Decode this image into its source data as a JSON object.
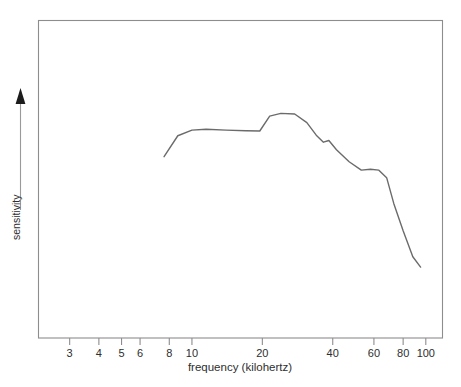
{
  "chart_data": {
    "type": "line",
    "title": "",
    "xlabel": "frequency (kilohertz)",
    "ylabel": "sensitivity",
    "xscale": "log",
    "xlim": [
      2.4,
      115
    ],
    "ylim": [
      0,
      1
    ],
    "grid": false,
    "legend": null,
    "xticks": [
      3,
      4,
      5,
      6,
      8,
      10,
      20,
      40,
      60,
      80,
      100
    ],
    "xtick_labels": [
      "3",
      "4",
      "5",
      "6",
      "8",
      "10",
      "20",
      "40",
      "60",
      "80",
      "100"
    ],
    "yticks": [],
    "ytick_labels": [],
    "series": [
      {
        "name": "sensitivity",
        "color": "#6b6b6b",
        "x": [
          7.6,
          8.7,
          10.0,
          11.5,
          14.0,
          17.0,
          19.5,
          21.5,
          24.0,
          27.5,
          31.0,
          34.0,
          36.5,
          38.5,
          41.5,
          47.0,
          53.0,
          58.0,
          63.0,
          68.0,
          73.0,
          80.0,
          88.0,
          95.0
        ],
        "y": [
          0.62,
          0.695,
          0.715,
          0.718,
          0.715,
          0.713,
          0.712,
          0.765,
          0.775,
          0.773,
          0.742,
          0.697,
          0.672,
          0.678,
          0.645,
          0.602,
          0.572,
          0.575,
          0.572,
          0.545,
          0.452,
          0.355,
          0.262,
          0.225
        ]
      }
    ],
    "annotations": {
      "y_axis_arrow": "upward arrow indicating increasing sensitivity"
    }
  },
  "axis": {
    "x_title": "frequency (kilohertz)",
    "y_title": "sensitivity"
  },
  "colors": {
    "curve": "#6b6b6b",
    "frame": "#8d8d8d",
    "text": "#2e2e2e",
    "background": "#ffffff"
  }
}
